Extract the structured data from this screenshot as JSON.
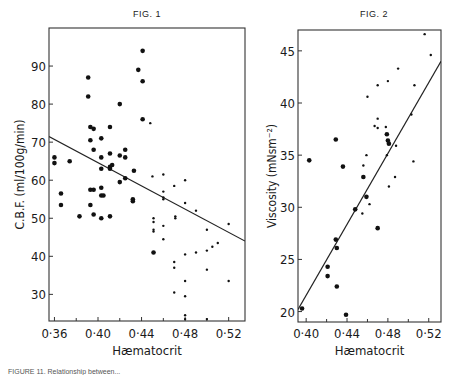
{
  "chart_data": [
    {
      "type": "scatter",
      "figure_label": "FIG. 1",
      "title": "FIG. 1",
      "xlabel": "Hæmatocrit",
      "ylabel": "C.B.F. (ml/100g/min)",
      "xlim": [
        0.355,
        0.535
      ],
      "ylim": [
        23,
        100
      ],
      "xticks": [
        "0·36",
        "0·40",
        "0·44",
        "0·48",
        "0·52"
      ],
      "xtick_values": [
        0.36,
        0.4,
        0.44,
        0.48,
        0.52
      ],
      "yticks": [
        30,
        40,
        50,
        60,
        70,
        80,
        90
      ],
      "grid": false,
      "series": [
        {
          "name": "large dots",
          "marker": "large",
          "points": [
            [
              0.36,
              66
            ],
            [
              0.36,
              64.5
            ],
            [
              0.366,
              56.5
            ],
            [
              0.366,
              53.5
            ],
            [
              0.374,
              65
            ],
            [
              0.383,
              50.5
            ],
            [
              0.391,
              87
            ],
            [
              0.391,
              82
            ],
            [
              0.393,
              74
            ],
            [
              0.393,
              70.5
            ],
            [
              0.393,
              57.5
            ],
            [
              0.393,
              53.5
            ],
            [
              0.396,
              73.5
            ],
            [
              0.396,
              68
            ],
            [
              0.396,
              57.5
            ],
            [
              0.396,
              51
            ],
            [
              0.403,
              71
            ],
            [
              0.403,
              66
            ],
            [
              0.403,
              63
            ],
            [
              0.403,
              58
            ],
            [
              0.403,
              56
            ],
            [
              0.405,
              56
            ],
            [
              0.403,
              50
            ],
            [
              0.411,
              74
            ],
            [
              0.411,
              67
            ],
            [
              0.411,
              63.5
            ],
            [
              0.411,
              63
            ],
            [
              0.413,
              64
            ],
            [
              0.411,
              50.5
            ],
            [
              0.42,
              80
            ],
            [
              0.42,
              66.5
            ],
            [
              0.42,
              59.5
            ],
            [
              0.425,
              68
            ],
            [
              0.425,
              66
            ],
            [
              0.425,
              60.5
            ],
            [
              0.437,
              89
            ],
            [
              0.441,
              94
            ],
            [
              0.441,
              86
            ],
            [
              0.441,
              76
            ],
            [
              0.432,
              55
            ],
            [
              0.432,
              54.5
            ],
            [
              0.433,
              62.5
            ],
            [
              0.451,
              41
            ]
          ]
        },
        {
          "name": "small dots",
          "marker": "small",
          "points": [
            [
              0.448,
              75
            ],
            [
              0.45,
              61
            ],
            [
              0.46,
              61.5
            ],
            [
              0.46,
              57
            ],
            [
              0.46,
              55.5
            ],
            [
              0.46,
              55
            ],
            [
              0.451,
              50
            ],
            [
              0.451,
              49
            ],
            [
              0.451,
              47
            ],
            [
              0.451,
              46.5
            ],
            [
              0.46,
              48
            ],
            [
              0.46,
              44.5
            ],
            [
              0.47,
              58.5
            ],
            [
              0.48,
              60
            ],
            [
              0.48,
              54
            ],
            [
              0.471,
              50.5
            ],
            [
              0.471,
              50
            ],
            [
              0.49,
              52
            ],
            [
              0.5,
              47
            ],
            [
              0.52,
              48.5
            ],
            [
              0.47,
              38.5
            ],
            [
              0.47,
              37
            ],
            [
              0.48,
              40.5
            ],
            [
              0.49,
              41
            ],
            [
              0.5,
              41.5
            ],
            [
              0.505,
              42.5
            ],
            [
              0.51,
              43.5
            ],
            [
              0.48,
              33.5
            ],
            [
              0.47,
              30.5
            ],
            [
              0.48,
              29.5
            ],
            [
              0.48,
              24.5
            ],
            [
              0.48,
              23.5
            ],
            [
              0.5,
              23.5
            ],
            [
              0.5,
              36.5
            ],
            [
              0.52,
              33.5
            ]
          ]
        }
      ],
      "regression_line": {
        "x": [
          0.355,
          0.535
        ],
        "y": [
          71.5,
          44
        ]
      }
    },
    {
      "type": "scatter",
      "figure_label": "FIG. 2",
      "title": "FIG. 2",
      "xlabel": "Hæmatocrit",
      "ylabel": "Viscosity (mNsm⁻²)",
      "xlim": [
        0.392,
        0.532
      ],
      "ylim": [
        19,
        47
      ],
      "xticks": [
        "0·40",
        "0·44",
        "0·48",
        "0·52"
      ],
      "xtick_values": [
        0.4,
        0.44,
        0.48,
        0.52
      ],
      "yticks": [
        20,
        25,
        30,
        35,
        40,
        45
      ],
      "grid": false,
      "series": [
        {
          "name": "large dots",
          "marker": "large",
          "points": [
            [
              0.396,
              20.3
            ],
            [
              0.403,
              34.5
            ],
            [
              0.421,
              24.3
            ],
            [
              0.421,
              23.4
            ],
            [
              0.429,
              26.9
            ],
            [
              0.43,
              26.1
            ],
            [
              0.429,
              36.5
            ],
            [
              0.43,
              22.4
            ],
            [
              0.436,
              33.9
            ],
            [
              0.439,
              19.7
            ],
            [
              0.448,
              29.8
            ],
            [
              0.456,
              32.9
            ],
            [
              0.459,
              31
            ],
            [
              0.47,
              28
            ],
            [
              0.479,
              37
            ],
            [
              0.48,
              36.4
            ],
            [
              0.481,
              36.1
            ]
          ]
        },
        {
          "name": "small dots",
          "marker": "small",
          "points": [
            [
              0.456,
              34
            ],
            [
              0.459,
              35
            ],
            [
              0.455,
              29.4
            ],
            [
              0.462,
              30.3
            ],
            [
              0.467,
              37.8
            ],
            [
              0.47,
              38.5
            ],
            [
              0.478,
              37.7
            ],
            [
              0.479,
              35
            ],
            [
              0.481,
              32
            ],
            [
              0.487,
              32.9
            ],
            [
              0.488,
              35.9
            ],
            [
              0.505,
              34.4
            ],
            [
              0.46,
              40.6
            ],
            [
              0.47,
              41.7
            ],
            [
              0.48,
              42.1
            ],
            [
              0.49,
              43.3
            ],
            [
              0.503,
              38.9
            ],
            [
              0.506,
              41.7
            ],
            [
              0.516,
              46.6
            ],
            [
              0.522,
              44.6
            ],
            [
              0.47,
              37.6
            ]
          ]
        }
      ],
      "regression_line": {
        "x": [
          0.392,
          0.532
        ],
        "y": [
          20.2,
          44
        ]
      }
    }
  ],
  "figures": {
    "fig1": {
      "title": "FIG. 1",
      "xlabel": "Hæmatocrit",
      "ylabel": "C.B.F. (ml/100g/min)"
    },
    "fig2": {
      "title": "FIG. 2",
      "xlabel": "Hæmatocrit",
      "ylabel": "Viscosity (mNsm⁻²)"
    }
  },
  "caption": "FIGURE 11. Relationship between..."
}
